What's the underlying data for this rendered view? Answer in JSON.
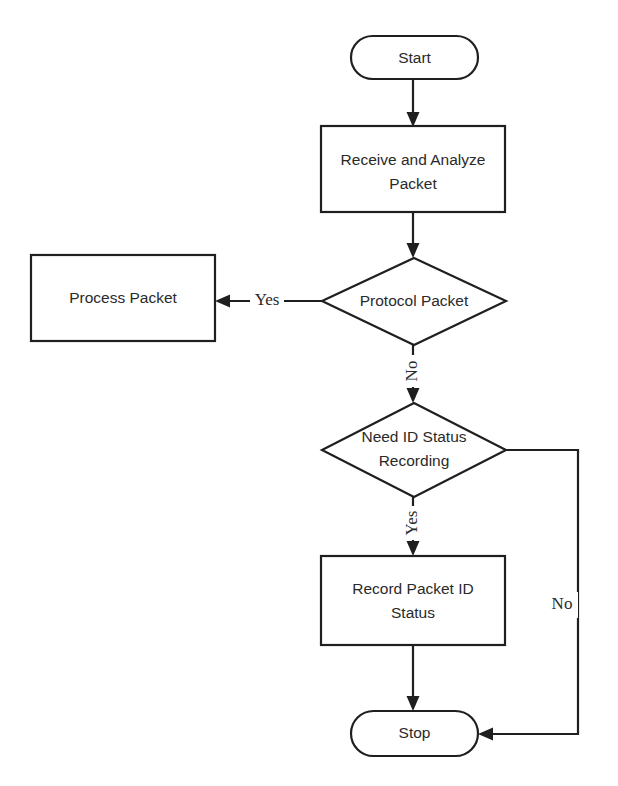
{
  "diagram": {
    "type": "flowchart",
    "orientation": "top-to-bottom",
    "background_color": "#ffffff",
    "line_color": "#1f1f1f",
    "text_color": "#2a2a2a",
    "nodes": [
      {
        "id": "start",
        "shape": "terminator",
        "label": "Start"
      },
      {
        "id": "receive",
        "shape": "process",
        "label_line1": "Receive and Analyze",
        "label_line2": "Packet"
      },
      {
        "id": "protocol",
        "shape": "decision",
        "label": "Protocol Packet"
      },
      {
        "id": "process",
        "shape": "process",
        "label": "Process Packet"
      },
      {
        "id": "needid",
        "shape": "decision",
        "label_line1": "Need ID Status",
        "label_line2": "Recording"
      },
      {
        "id": "record",
        "shape": "process",
        "label_line1": "Record Packet ID",
        "label_line2": "Status"
      },
      {
        "id": "stop",
        "shape": "terminator",
        "label": "Stop"
      }
    ],
    "edges": [
      {
        "from": "start",
        "to": "receive",
        "label": ""
      },
      {
        "from": "receive",
        "to": "protocol",
        "label": ""
      },
      {
        "from": "protocol",
        "to": "process",
        "label": "Yes",
        "direction": "left",
        "label_orientation": "horizontal"
      },
      {
        "from": "protocol",
        "to": "needid",
        "label": "No",
        "direction": "down",
        "label_orientation": "vertical"
      },
      {
        "from": "needid",
        "to": "record",
        "label": "Yes",
        "direction": "down",
        "label_orientation": "vertical"
      },
      {
        "from": "needid",
        "to": "stop",
        "label": "No",
        "direction": "right-around",
        "label_orientation": "horizontal"
      },
      {
        "from": "record",
        "to": "stop",
        "label": ""
      }
    ]
  }
}
